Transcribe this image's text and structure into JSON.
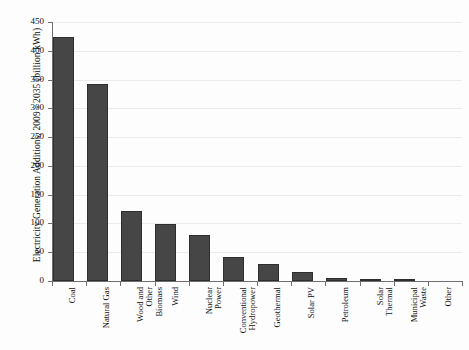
{
  "chart_data": {
    "type": "bar",
    "title": "",
    "xlabel": "",
    "ylabel": "Electricity Generation Additions, 2009 - 2035 (billion kWh)",
    "ylim": [
      0,
      450
    ],
    "ytick_step": 50,
    "yticks": [
      "450",
      "400",
      "350",
      "300",
      "250",
      "200",
      "150",
      "100",
      "50",
      "0"
    ],
    "grid": true,
    "legend": "none",
    "bar_color": "#464646",
    "categories": [
      "Coal",
      "Natural Gas",
      "Wood and Other Biomass",
      "Wind",
      "Nuclear Power",
      "Conventional Hydropower",
      "Geothermal",
      "Solar PV",
      "Petroleum",
      "Solar Thermal",
      "Municipal Waste",
      "Other"
    ],
    "category_lines": [
      [
        "Coal"
      ],
      [
        "Natural Gas"
      ],
      [
        "Wood and",
        "Other",
        "Biomass"
      ],
      [
        "Wind"
      ],
      [
        "Nuclear",
        "Power"
      ],
      [
        "Conventional",
        "Hydropower"
      ],
      [
        "Geothermal"
      ],
      [
        "Solar PV"
      ],
      [
        "Petroleum"
      ],
      [
        "Solar",
        "Thermal"
      ],
      [
        "Municipal",
        "Waste"
      ],
      [
        "Other"
      ]
    ],
    "values": [
      424,
      342,
      121,
      99,
      80,
      41,
      29,
      15,
      5,
      2,
      1,
      0
    ]
  }
}
